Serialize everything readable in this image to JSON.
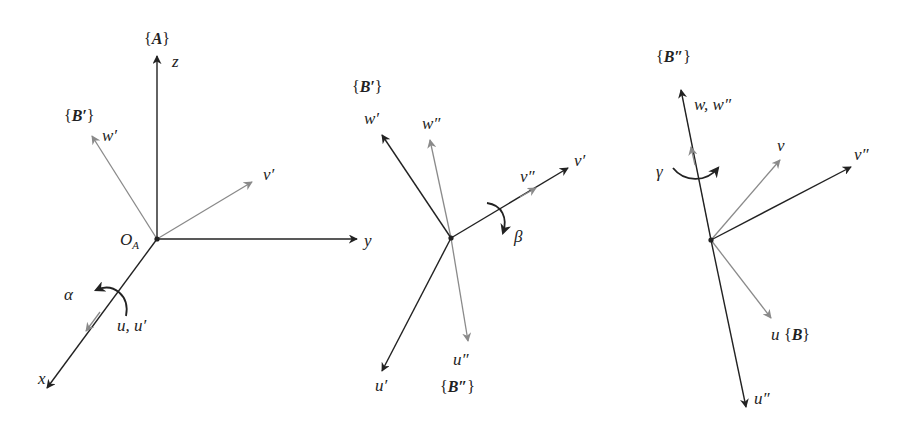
{
  "figure": {
    "colors": {
      "primary_axis": "#222222",
      "secondary_axis": "#8a8a8a",
      "background": "#ffffff"
    }
  },
  "panels": [
    {
      "id": "panel-1",
      "origin_label": "O",
      "origin_sub": "A",
      "frame_top": {
        "open": "{",
        "name": "A",
        "close": "}"
      },
      "frame_rotated": {
        "open": "{",
        "name": "B′",
        "close": "}"
      },
      "axes": {
        "z": "z",
        "y": "y",
        "x": "x",
        "w": "w′",
        "v": "v′",
        "u": "u, u′"
      },
      "rotation": {
        "symbol": "α",
        "about": "u"
      }
    },
    {
      "id": "panel-2",
      "frame_top": {
        "open": "{",
        "name": "B′",
        "close": "}"
      },
      "frame_bottom": {
        "open": "{",
        "name": "B″",
        "close": "}"
      },
      "axes": {
        "w1": "w′",
        "w2": "w″",
        "v1": "v′",
        "v2": "v″",
        "u1": "u′",
        "u2": "u″"
      },
      "rotation": {
        "symbol": "β",
        "about": "v′"
      }
    },
    {
      "id": "panel-3",
      "frame_top": {
        "open": "{",
        "name": "B″",
        "close": "}"
      },
      "frame_result": {
        "open": "{",
        "name": "B",
        "close": "}"
      },
      "axes": {
        "w": "w, w″",
        "v": "v",
        "v2": "v″",
        "u": "u",
        "u2": "u″"
      },
      "rotation": {
        "symbol": "γ",
        "about": "w″"
      }
    }
  ]
}
